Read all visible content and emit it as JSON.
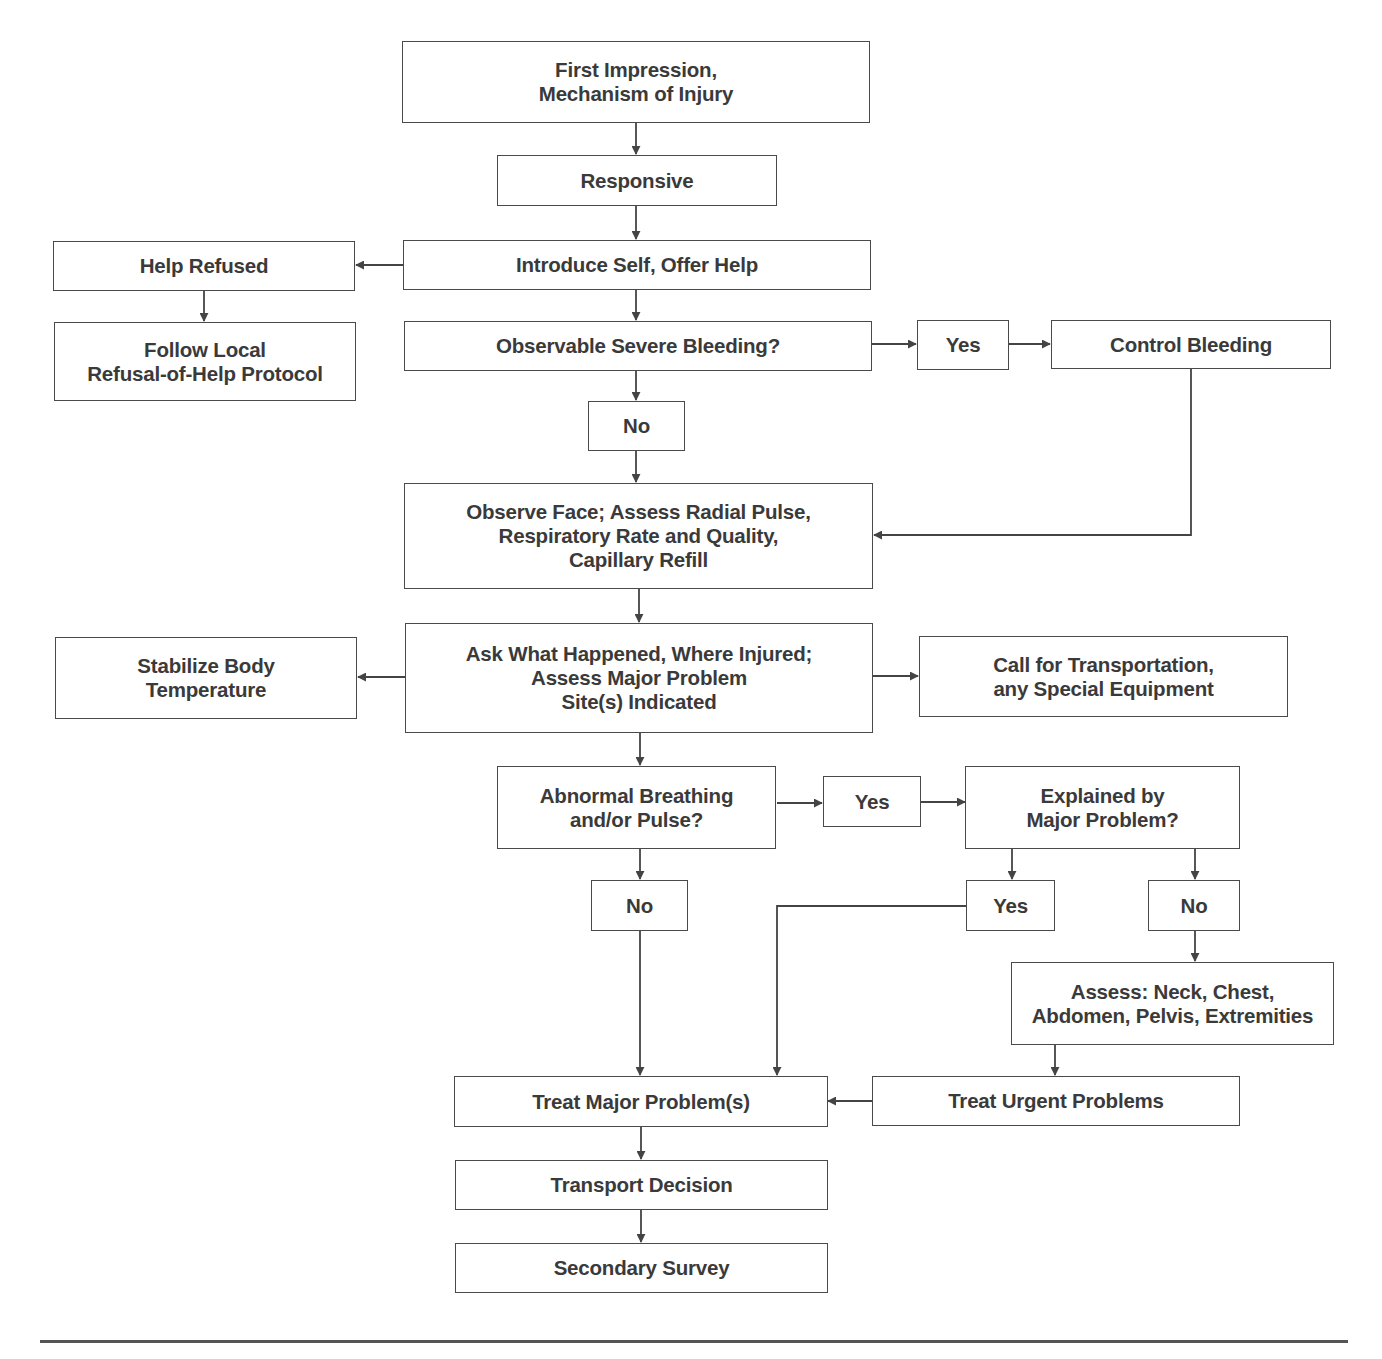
{
  "flowchart": {
    "nodes": {
      "first_impression": "First Impression,\nMechanism of Injury",
      "responsive": "Responsive",
      "introduce_self": "Introduce Self, Offer Help",
      "help_refused": "Help Refused",
      "refusal_protocol": "Follow Local\nRefusal-of-Help Protocol",
      "severe_bleeding": "Observable Severe Bleeding?",
      "bleeding_yes": "Yes",
      "control_bleeding": "Control Bleeding",
      "bleeding_no": "No",
      "observe_face": "Observe Face; Assess Radial Pulse,\nRespiratory Rate and Quality,\nCapillary Refill",
      "ask_what_happened": "Ask What Happened, Where Injured;\nAssess Major Problem\nSite(s) Indicated",
      "stabilize_temp": "Stabilize Body\nTemperature",
      "call_transport": "Call for Transportation,\nany Special Equipment",
      "abnormal_breathing": "Abnormal Breathing\nand/or Pulse?",
      "breathing_yes": "Yes",
      "explained_major": "Explained by\nMajor Problem?",
      "breathing_no": "No",
      "explained_yes": "Yes",
      "explained_no": "No",
      "assess_regions": "Assess: Neck, Chest,\nAbdomen, Pelvis, Extremities",
      "treat_major": "Treat Major Problem(s)",
      "treat_urgent": "Treat Urgent Problems",
      "transport_decision": "Transport Decision",
      "secondary_survey": "Secondary Survey"
    },
    "colors": {
      "line": "#444444",
      "box_border": "#4a4a4a",
      "text": "#3a3a3a",
      "background": "#ffffff"
    }
  }
}
